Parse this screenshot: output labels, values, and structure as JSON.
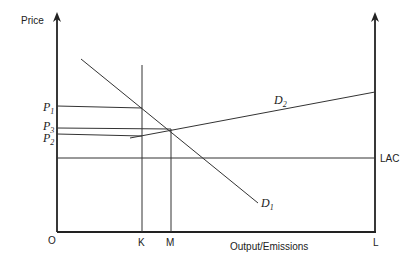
{
  "diagram": {
    "y_axis_label": "Price",
    "x_axis_label": "Output/Emissions",
    "origin_label": "O",
    "x_ticks": [
      {
        "label": "K",
        "x": 142
      },
      {
        "label": "M",
        "x": 171
      },
      {
        "label": "L",
        "x": 375
      }
    ],
    "price_levels": [
      {
        "label": "P",
        "sub": "1",
        "y": 107
      },
      {
        "label": "P",
        "sub": "3",
        "y": 128
      },
      {
        "label": "P",
        "sub": "2",
        "y": 134
      }
    ],
    "curves": {
      "d1": {
        "label": "D",
        "sub": "1"
      },
      "d2": {
        "label": "D",
        "sub": "2"
      },
      "lac": {
        "label": "LAC"
      }
    },
    "line_color": "#333333"
  }
}
